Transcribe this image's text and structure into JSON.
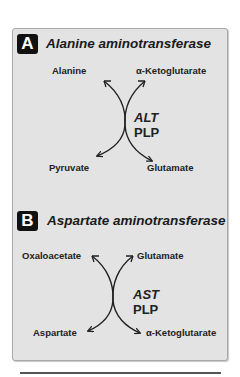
{
  "panels": [
    {
      "badge": "A",
      "title": "Alanine aminotransferase",
      "top_left": "Alanine",
      "top_right": "α-Ketoglutarate",
      "bottom_left": "Pyruvate",
      "bottom_right": "Glutamate",
      "enzyme": "ALT",
      "cofactor": "PLP"
    },
    {
      "badge": "B",
      "title": "Aspartate aminotransferase",
      "top_left": "Oxaloacetate",
      "top_right": "Glutamate",
      "bottom_left": "Aspartate",
      "bottom_right": "α-Ketoglutarate",
      "enzyme": "AST",
      "cofactor": "PLP"
    }
  ],
  "colors": {
    "panel_bg": "#e3e3e3",
    "badge_bg": "#111111",
    "text": "#1a1a1a"
  }
}
